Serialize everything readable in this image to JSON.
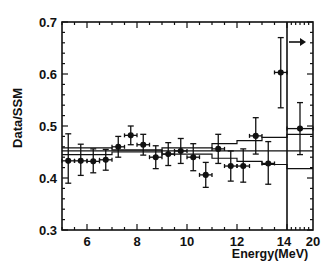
{
  "chart_data": {
    "type": "scatter",
    "title": "",
    "xlabel": "Energy(MeV)",
    "ylabel": "Data/SSM",
    "xlim": [
      5,
      20
    ],
    "ylim": [
      0.3,
      0.7
    ],
    "x_ticks": [
      "6",
      "8",
      "10",
      "12",
      "14",
      "20"
    ],
    "y_ticks": [
      "0.3",
      "0.4",
      "0.5",
      "0.6",
      "0.7"
    ],
    "x_break_at": 14,
    "grid": false,
    "legend": [],
    "series": [
      {
        "name": "Data/SSM",
        "points": [
          {
            "x": 5.25,
            "xerr": 0.25,
            "y": 0.433,
            "ylo": 0.39,
            "yhi": 0.485
          },
          {
            "x": 5.75,
            "xerr": 0.25,
            "y": 0.433,
            "ylo": 0.405,
            "yhi": 0.465
          },
          {
            "x": 6.25,
            "xerr": 0.25,
            "y": 0.432,
            "ylo": 0.41,
            "yhi": 0.456
          },
          {
            "x": 6.75,
            "xerr": 0.25,
            "y": 0.435,
            "ylo": 0.415,
            "yhi": 0.455
          },
          {
            "x": 7.25,
            "xerr": 0.25,
            "y": 0.46,
            "ylo": 0.44,
            "yhi": 0.48
          },
          {
            "x": 7.75,
            "xerr": 0.25,
            "y": 0.482,
            "ylo": 0.464,
            "yhi": 0.5
          },
          {
            "x": 8.25,
            "xerr": 0.25,
            "y": 0.464,
            "ylo": 0.444,
            "yhi": 0.484
          },
          {
            "x": 8.75,
            "xerr": 0.25,
            "y": 0.44,
            "ylo": 0.418,
            "yhi": 0.462
          },
          {
            "x": 9.25,
            "xerr": 0.25,
            "y": 0.446,
            "ylo": 0.424,
            "yhi": 0.468
          },
          {
            "x": 9.75,
            "xerr": 0.25,
            "y": 0.452,
            "ylo": 0.428,
            "yhi": 0.476
          },
          {
            "x": 10.25,
            "xerr": 0.25,
            "y": 0.44,
            "ylo": 0.414,
            "yhi": 0.466
          },
          {
            "x": 10.75,
            "xerr": 0.25,
            "y": 0.406,
            "ylo": 0.382,
            "yhi": 0.43
          },
          {
            "x": 11.25,
            "xerr": 0.25,
            "y": 0.456,
            "ylo": 0.428,
            "yhi": 0.484
          },
          {
            "x": 11.75,
            "xerr": 0.25,
            "y": 0.423,
            "ylo": 0.394,
            "yhi": 0.452
          },
          {
            "x": 12.25,
            "xerr": 0.25,
            "y": 0.423,
            "ylo": 0.392,
            "yhi": 0.456
          },
          {
            "x": 12.75,
            "xerr": 0.25,
            "y": 0.481,
            "ylo": 0.446,
            "yhi": 0.516
          },
          {
            "x": 13.25,
            "xerr": 0.25,
            "y": 0.428,
            "ylo": 0.388,
            "yhi": 0.47
          },
          {
            "x": 13.75,
            "xerr": 0.25,
            "y": 0.603,
            "ylo": 0.535,
            "yhi": 0.67
          },
          {
            "x": 17.0,
            "xerr": 3.0,
            "y": 0.495,
            "ylo": 0.445,
            "yhi": 0.545,
            "label": "14-20"
          }
        ]
      },
      {
        "name": "Flat fit",
        "type": "line",
        "y": 0.452
      },
      {
        "name": "Upper band",
        "type": "step",
        "x": [
          5,
          7,
          9,
          11,
          12,
          13,
          14,
          20
        ],
        "y": [
          0.445,
          0.45,
          0.458,
          0.466,
          0.472,
          0.478,
          0.484,
          0.497
        ]
      },
      {
        "name": "Lower band",
        "type": "step",
        "x": [
          5,
          7,
          9,
          11,
          12,
          13,
          14,
          20
        ],
        "y": [
          0.458,
          0.454,
          0.446,
          0.438,
          0.432,
          0.426,
          0.418,
          0.412
        ]
      }
    ],
    "annotations": [
      {
        "text": "arrow-right",
        "x": 14,
        "y": 0.66
      }
    ]
  },
  "axes": {
    "xlabel": "Energy(MeV)",
    "ylabel": "Data/SSM"
  }
}
